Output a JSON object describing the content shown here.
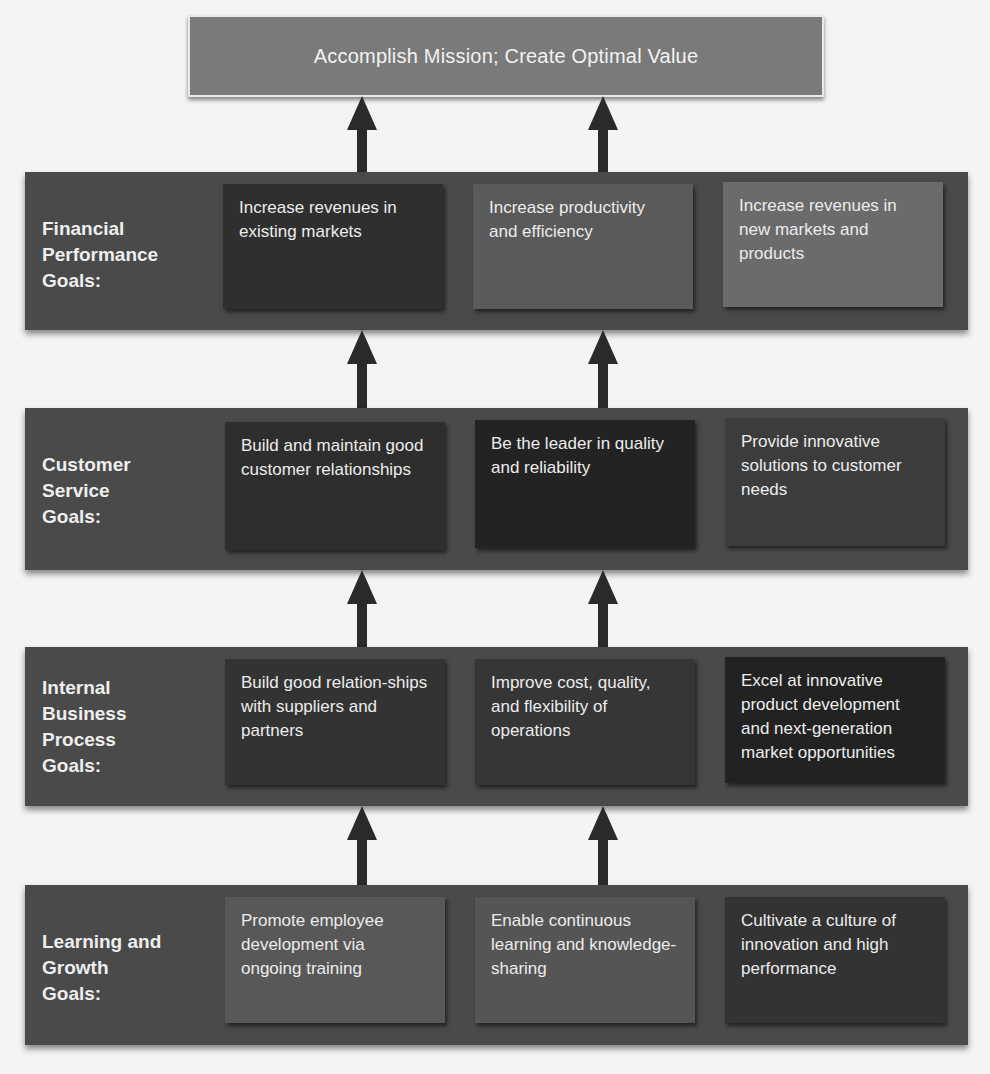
{
  "mission": {
    "label": "Accomplish Mission; Create Optimal Value",
    "color": "#7a7a7a"
  },
  "colors": {
    "band": "#4a4a4a",
    "arrow": "#2a2a2a",
    "background": "#f4f4f3",
    "text": "#ececec"
  },
  "rows": [
    {
      "label_lines": [
        "Financial",
        "Performance",
        "Goals:"
      ],
      "goals": [
        {
          "text": "Increase revenues in existing markets",
          "color": "#2f2f2f"
        },
        {
          "text": "Increase productivity and efficiency",
          "color": "#5a5a5a"
        },
        {
          "text": "Increase revenues in new markets and products",
          "color": "#6b6b6b"
        }
      ]
    },
    {
      "label_lines": [
        "Customer",
        "Service",
        "Goals:"
      ],
      "goals": [
        {
          "text": "Build and maintain good customer relationships",
          "color": "#2e2e2e"
        },
        {
          "text": "Be the leader in quality and reliability",
          "color": "#232323"
        },
        {
          "text": "Provide innovative solutions to customer needs",
          "color": "#3c3c3c"
        }
      ]
    },
    {
      "label_lines": [
        "Internal",
        "Business",
        "Process",
        "Goals:"
      ],
      "goals": [
        {
          "text": "Build good relation-ships with suppliers and partners",
          "color": "#333333"
        },
        {
          "text": "Improve cost, quality, and flexibility of operations",
          "color": "#363636"
        },
        {
          "text": "Excel at innovative product development and next-generation market opportunities",
          "color": "#222222"
        }
      ]
    },
    {
      "label_lines": [
        "Learning and",
        "Growth",
        "Goals:"
      ],
      "goals": [
        {
          "text": "Promote employee development via ongoing training",
          "color": "#585858"
        },
        {
          "text": "Enable continuous learning and knowledge-sharing",
          "color": "#555555"
        },
        {
          "text": "Cultivate a culture of innovation and high performance",
          "color": "#333333"
        }
      ]
    }
  ]
}
